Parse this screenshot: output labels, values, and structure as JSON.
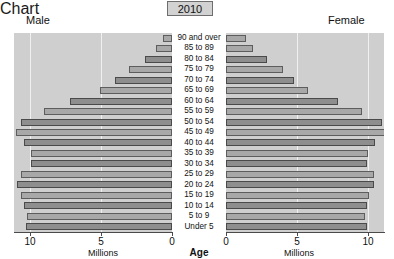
{
  "header": {
    "year_badge": "2010",
    "male_label": "Male",
    "female_label": "Female"
  },
  "axes": {
    "center_title": "Age",
    "left_unit": "Millions",
    "right_unit": "Millions",
    "left_ticks": [
      "10",
      "5",
      "0"
    ],
    "right_ticks": [
      "0",
      "5",
      "10"
    ]
  },
  "chart_data": {
    "type": "bar",
    "subtype": "population-pyramid",
    "title": "2010",
    "xlabel": "Millions",
    "ylabel": "Age",
    "grid": true,
    "legend_position": "top-outside",
    "orientation": "horizontal",
    "xlim": [
      0,
      11.5
    ],
    "x_ticks": [
      0,
      5,
      10
    ],
    "categories": [
      "90 and over",
      "85 to 89",
      "80 to 84",
      "75 to 79",
      "70 to 74",
      "65 to 69",
      "60 to 64",
      "55 to 59",
      "50 to 54",
      "45 to 49",
      "40 to 44",
      "35 to 39",
      "30 to 34",
      "25 to 29",
      "20 to 24",
      "15 to 19",
      "10 to 14",
      "5 to 9",
      "Under 5"
    ],
    "series": [
      {
        "name": "Male",
        "side": "left",
        "values": [
          0.6,
          1.1,
          1.9,
          3.0,
          4.0,
          5.1,
          7.2,
          9.0,
          10.6,
          11.0,
          10.4,
          9.9,
          9.9,
          10.6,
          10.9,
          10.6,
          10.4,
          10.2,
          10.3
        ]
      },
      {
        "name": "Female",
        "side": "right",
        "values": [
          1.4,
          1.9,
          2.9,
          4.0,
          4.8,
          5.8,
          7.9,
          9.6,
          11.0,
          11.2,
          10.5,
          10.0,
          9.9,
          10.4,
          10.4,
          10.1,
          9.9,
          9.8,
          9.9
        ]
      }
    ]
  },
  "colors": {
    "plot_background": "#cfcfcf",
    "bar_fill": "#a8a8a8",
    "bar_fill_dark": "#8e8e8e",
    "bar_stroke": "#5d5d5d",
    "gridline": "#f0f0f0",
    "axis": "#4a4a4a",
    "badge_background": "#d2d2d2"
  }
}
